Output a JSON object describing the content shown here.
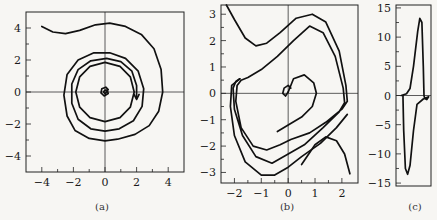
{
  "chart_data": [
    {
      "id": "a",
      "type": "line",
      "caption": "(a)",
      "title": "",
      "xlabel": "",
      "ylabel": "",
      "xlim": [
        -5,
        5
      ],
      "ylim": [
        -5,
        5
      ],
      "xticks": [
        -4,
        -2,
        0,
        2,
        4
      ],
      "yticks": [
        -4,
        -2,
        0,
        2,
        4
      ],
      "xtick_labels": [
        "−4",
        "−2",
        "0",
        "2",
        "4"
      ],
      "ytick_labels": [
        "−4",
        "−2",
        "0",
        "2",
        "4"
      ],
      "grid": false,
      "description": "Phase-plane trajectory starting near (-4, 4.2), spiralling inward to a small loop at the origin",
      "series": [
        {
          "name": "trajectory",
          "points": [
            [
              -4.0,
              4.1
            ],
            [
              -3.3,
              3.75
            ],
            [
              -2.5,
              3.65
            ],
            [
              -1.6,
              3.85
            ],
            [
              -0.6,
              4.2
            ],
            [
              0.3,
              4.3
            ],
            [
              1.3,
              4.1
            ],
            [
              2.3,
              3.6
            ],
            [
              3.1,
              2.7
            ],
            [
              3.55,
              1.4
            ],
            [
              3.65,
              0
            ],
            [
              3.4,
              -1.2
            ],
            [
              2.8,
              -2.1
            ],
            [
              1.9,
              -2.65
            ],
            [
              0.8,
              -2.95
            ],
            [
              0,
              -3.05
            ],
            [
              -1.0,
              -2.9
            ],
            [
              -1.9,
              -2.4
            ],
            [
              -2.4,
              -1.5
            ],
            [
              -2.6,
              -0.2
            ],
            [
              -2.4,
              1.1
            ],
            [
              -1.7,
              2.0
            ],
            [
              -0.7,
              2.45
            ],
            [
              0.3,
              2.45
            ],
            [
              1.3,
              2.1
            ],
            [
              2.1,
              1.3
            ],
            [
              2.45,
              0.2
            ],
            [
              2.35,
              -0.9
            ],
            [
              1.8,
              -1.8
            ],
            [
              0.9,
              -2.3
            ],
            [
              0,
              -2.45
            ],
            [
              -0.9,
              -2.3
            ],
            [
              -1.7,
              -1.7
            ],
            [
              -2.1,
              -0.7
            ],
            [
              -2.1,
              0.5
            ],
            [
              -1.7,
              1.4
            ],
            [
              -0.9,
              1.95
            ],
            [
              0.1,
              2.1
            ],
            [
              1.0,
              1.9
            ],
            [
              1.7,
              1.3
            ],
            [
              2.0,
              0.4
            ],
            [
              2.0,
              -0.4
            ]
          ]
        },
        {
          "name": "inner-circle",
          "points": [
            [
              0,
              1.85
            ],
            [
              0.95,
              1.6
            ],
            [
              1.6,
              0.95
            ],
            [
              1.85,
              0
            ],
            [
              1.6,
              -0.95
            ],
            [
              0.95,
              -1.6
            ],
            [
              0,
              -1.85
            ],
            [
              -0.95,
              -1.6
            ],
            [
              -1.6,
              -0.95
            ],
            [
              -1.85,
              0
            ],
            [
              -1.6,
              0.95
            ],
            [
              -0.95,
              1.6
            ],
            [
              0,
              1.85
            ]
          ]
        },
        {
          "name": "center-loop",
          "points": [
            [
              0.2,
              0.15
            ],
            [
              0.05,
              0.3
            ],
            [
              -0.2,
              0.2
            ],
            [
              -0.25,
              -0.05
            ],
            [
              -0.05,
              -0.25
            ],
            [
              0.2,
              -0.1
            ],
            [
              0.15,
              0.1
            ],
            [
              0,
              0.12
            ],
            [
              -0.1,
              0
            ],
            [
              0,
              -0.1
            ],
            [
              0.1,
              0
            ]
          ]
        }
      ],
      "annotations": [
        {
          "type": "arrow",
          "at": [
            2.0,
            -0.4
          ],
          "direction": "down"
        }
      ]
    },
    {
      "id": "b",
      "type": "line",
      "caption": "(b)",
      "title": "",
      "xlabel": "",
      "ylabel": "",
      "xlim": [
        -2.5,
        2.6
      ],
      "ylim": [
        -3.4,
        3.35
      ],
      "xticks": [
        -2,
        -1,
        0,
        1,
        2
      ],
      "yticks": [
        -3,
        -2,
        -1,
        0,
        1,
        2,
        3
      ],
      "xtick_labels": [
        "−2",
        "−1",
        "0",
        "1",
        "2"
      ],
      "ytick_labels": [
        "−3",
        "−2",
        "−1",
        "0",
        "1",
        "2",
        "3"
      ],
      "grid": false,
      "description": "Phase-plane trajectories of a relaxation oscillator approaching a limit cycle",
      "series": [
        {
          "name": "outer-top",
          "points": [
            [
              -2.3,
              3.35
            ],
            [
              -2.0,
              2.8
            ],
            [
              -1.6,
              2.1
            ],
            [
              -1.2,
              1.8
            ],
            [
              -0.8,
              1.9
            ],
            [
              -0.3,
              2.3
            ],
            [
              0.3,
              2.85
            ],
            [
              0.9,
              3.0
            ],
            [
              1.4,
              2.7
            ],
            [
              1.9,
              1.6
            ],
            [
              2.15,
              0.3
            ],
            [
              2.2,
              -0.3
            ],
            [
              2.0,
              -0.6
            ],
            [
              1.4,
              -1.1
            ],
            [
              0.8,
              -1.5
            ],
            [
              0.1,
              -1.75
            ],
            [
              -0.3,
              -1.95
            ],
            [
              -0.8,
              -2.15
            ],
            [
              -1.3,
              -2.0
            ],
            [
              -1.75,
              -1.3
            ],
            [
              -1.95,
              -0.3
            ],
            [
              -1.9,
              0.3
            ],
            [
              -1.75,
              0.5
            ],
            [
              -1.5,
              0.6
            ],
            [
              -1.0,
              0.9
            ],
            [
              -0.4,
              1.4
            ],
            [
              0.2,
              2.0
            ],
            [
              0.8,
              2.55
            ],
            [
              1.3,
              2.3
            ],
            [
              1.75,
              1.4
            ],
            [
              2.05,
              0.2
            ],
            [
              2.1,
              -0.35
            ],
            [
              1.9,
              -0.7
            ],
            [
              1.3,
              -1.3
            ],
            [
              0.6,
              -1.95
            ],
            [
              0,
              -2.3
            ],
            [
              -0.6,
              -2.65
            ],
            [
              -1.2,
              -2.4
            ],
            [
              -1.7,
              -1.6
            ],
            [
              -2.0,
              -0.6
            ],
            [
              -2.05,
              0.2
            ],
            [
              -1.95,
              0.45
            ],
            [
              -1.8,
              0.55
            ]
          ]
        },
        {
          "name": "outer-loop",
          "points": [
            [
              -1.8,
              0.55
            ],
            [
              -2.1,
              0.3
            ],
            [
              -2.15,
              -0.5
            ],
            [
              -2.0,
              -1.6
            ],
            [
              -1.6,
              -2.6
            ],
            [
              -1.0,
              -3.1
            ],
            [
              -0.5,
              -3.1
            ],
            [
              0,
              -2.8
            ],
            [
              0.5,
              -2.4
            ],
            [
              1.2,
              -1.9
            ],
            [
              1.8,
              -1.3
            ],
            [
              2.2,
              -0.8
            ]
          ]
        },
        {
          "name": "lower-right",
          "points": [
            [
              0.5,
              -2.7
            ],
            [
              1.0,
              -1.95
            ],
            [
              1.4,
              -1.65
            ],
            [
              1.8,
              -1.8
            ],
            [
              2.1,
              -2.3
            ],
            [
              2.3,
              -3.05
            ]
          ]
        },
        {
          "name": "inner-spiral",
          "points": [
            [
              0,
              0.05
            ],
            [
              0.2,
              0.55
            ],
            [
              0.6,
              0.7
            ],
            [
              0.95,
              0.4
            ],
            [
              1.05,
              0
            ],
            [
              0.9,
              -0.5
            ],
            [
              0.5,
              -0.9
            ],
            [
              0,
              -1.2
            ],
            [
              -0.4,
              -1.45
            ]
          ]
        },
        {
          "name": "inner-start",
          "points": [
            [
              0,
              0.05
            ],
            [
              -0.1,
              -0.1
            ],
            [
              -0.2,
              0
            ],
            [
              -0.15,
              0.2
            ],
            [
              0,
              0.3
            ],
            [
              0.1,
              0.2
            ]
          ]
        }
      ]
    },
    {
      "id": "c",
      "type": "line",
      "caption": "(c)",
      "title": "",
      "xlabel": "",
      "ylabel": "",
      "xlim": [
        0,
        1
      ],
      "ylim": [
        -15.5,
        15.5
      ],
      "xticks": [],
      "yticks": [
        -15,
        -10,
        -5,
        0,
        5,
        10,
        15
      ],
      "xtick_labels": [],
      "ytick_labels": [
        "−15",
        "−10",
        "−5",
        "0",
        "5",
        "10",
        "15"
      ],
      "grid": false,
      "description": "Narrow phase portrait showing a closed cycle with peak near +13 and trough near -13.5",
      "series": [
        {
          "name": "cycle",
          "points": [
            [
              0.15,
              0
            ],
            [
              0.3,
              0.3
            ],
            [
              0.4,
              1.2
            ],
            [
              0.5,
              5
            ],
            [
              0.62,
              11
            ],
            [
              0.68,
              13.2
            ],
            [
              0.74,
              12.5
            ],
            [
              0.78,
              5
            ],
            [
              0.8,
              0
            ],
            [
              0.82,
              -0.5
            ],
            [
              0.88,
              -0.7
            ],
            [
              0.93,
              -0.2
            ],
            [
              0.78,
              -0.6
            ],
            [
              0.6,
              -1.5
            ],
            [
              0.5,
              -6
            ],
            [
              0.4,
              -12
            ],
            [
              0.33,
              -13.5
            ],
            [
              0.27,
              -12.5
            ],
            [
              0.22,
              -6
            ],
            [
              0.2,
              -0.5
            ],
            [
              0.2,
              0
            ],
            [
              0.15,
              0
            ]
          ]
        }
      ]
    }
  ]
}
